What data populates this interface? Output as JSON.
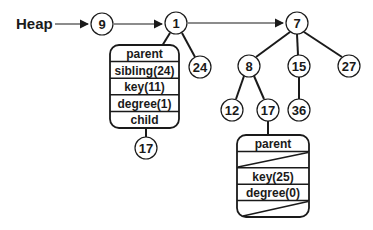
{
  "diagram": {
    "title": "Heap",
    "root_list": [
      "9",
      "1",
      "7"
    ],
    "nodes": {
      "n9": "9",
      "n1": "1",
      "n24": "24",
      "n17a": "17",
      "n7": "7",
      "n8": "8",
      "n15": "15",
      "n27": "27",
      "n12": "12",
      "n17b": "17",
      "n36": "36"
    },
    "record1": {
      "fields": [
        "parent",
        "sibling(24)",
        "key(11)",
        "degree(1)",
        "child"
      ]
    },
    "record2": {
      "fields": [
        "parent",
        "",
        "key(25)",
        "degree(0)",
        ""
      ],
      "null_fields": [
        "sibling",
        "child"
      ]
    }
  }
}
